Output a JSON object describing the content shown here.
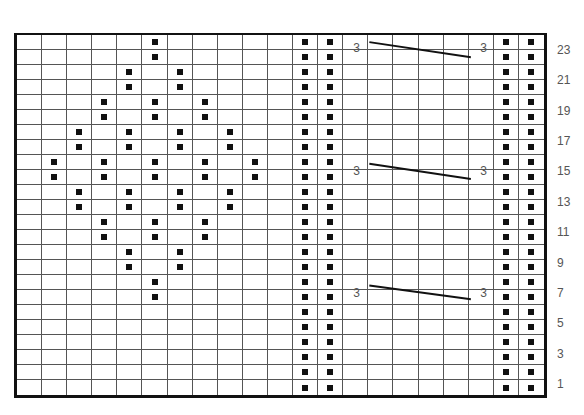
{
  "chart": {
    "title": "",
    "columns": 21,
    "rows": 24,
    "symbol": "purl-dot",
    "colors": {
      "grid": "#555555",
      "border": "#111111",
      "dot": "#111111",
      "label": "#555555"
    },
    "row_labels": [
      {
        "row": 23,
        "text": "23"
      },
      {
        "row": 21,
        "text": "21"
      },
      {
        "row": 19,
        "text": "19"
      },
      {
        "row": 17,
        "text": "17"
      },
      {
        "row": 15,
        "text": "15"
      },
      {
        "row": 13,
        "text": "13"
      },
      {
        "row": 11,
        "text": "11"
      },
      {
        "row": 9,
        "text": "9"
      },
      {
        "row": 7,
        "text": "7"
      },
      {
        "row": 5,
        "text": "5"
      },
      {
        "row": 3,
        "text": "3"
      },
      {
        "row": 1,
        "text": "1"
      }
    ],
    "dot_rows_from_top": [
      [
        5,
        11,
        12,
        19,
        20
      ],
      [
        5,
        11,
        12,
        19,
        20
      ],
      [
        4,
        6,
        11,
        12,
        19,
        20
      ],
      [
        4,
        6,
        11,
        12,
        19,
        20
      ],
      [
        3,
        5,
        7,
        11,
        12,
        19,
        20
      ],
      [
        3,
        5,
        7,
        11,
        12,
        19,
        20
      ],
      [
        2,
        4,
        6,
        8,
        11,
        12,
        19,
        20
      ],
      [
        2,
        4,
        6,
        8,
        11,
        12,
        19,
        20
      ],
      [
        1,
        3,
        5,
        7,
        9,
        11,
        12,
        19,
        20
      ],
      [
        1,
        3,
        5,
        7,
        9,
        11,
        12,
        19,
        20
      ],
      [
        2,
        4,
        6,
        8,
        11,
        12,
        19,
        20
      ],
      [
        2,
        4,
        6,
        8,
        11,
        12,
        19,
        20
      ],
      [
        3,
        5,
        7,
        11,
        12,
        19,
        20
      ],
      [
        3,
        5,
        7,
        11,
        12,
        19,
        20
      ],
      [
        4,
        6,
        11,
        12,
        19,
        20
      ],
      [
        4,
        6,
        11,
        12,
        19,
        20
      ],
      [
        5,
        11,
        12,
        19,
        20
      ],
      [
        5,
        11,
        12,
        19,
        20
      ],
      [
        11,
        12,
        19,
        20
      ],
      [
        11,
        12,
        19,
        20
      ],
      [
        11,
        12,
        19,
        20
      ],
      [
        11,
        12,
        19,
        20
      ],
      [
        11,
        12,
        19,
        20
      ],
      [
        11,
        12,
        19,
        20
      ]
    ],
    "cables": [
      {
        "left_label": "3",
        "right_label": "3",
        "from_col": 14,
        "to_col": 17,
        "start_row_line": 0.6,
        "end_row_line": 1.6,
        "label_row_center": 1.0
      },
      {
        "left_label": "3",
        "right_label": "3",
        "from_col": 14,
        "to_col": 17,
        "start_row_line": 8.6,
        "end_row_line": 9.6,
        "label_row_center": 9.1
      },
      {
        "left_label": "3",
        "right_label": "3",
        "from_col": 14,
        "to_col": 17,
        "start_row_line": 16.6,
        "end_row_line": 17.5,
        "label_row_center": 17.1
      }
    ]
  }
}
